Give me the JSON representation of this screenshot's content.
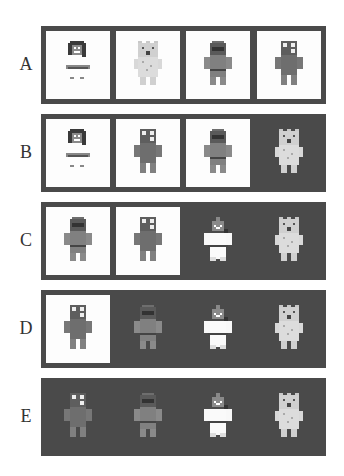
{
  "figure": {
    "rows": [
      {
        "label": "A",
        "cells": [
          {
            "character": "girl",
            "background": "light"
          },
          {
            "character": "bear",
            "background": "light"
          },
          {
            "character": "hooded",
            "background": "light"
          },
          {
            "character": "robot",
            "background": "light"
          }
        ]
      },
      {
        "label": "B",
        "cells": [
          {
            "character": "girl",
            "background": "light"
          },
          {
            "character": "robot",
            "background": "light"
          },
          {
            "character": "hooded",
            "background": "light"
          },
          {
            "character": "bear",
            "background": "dark"
          }
        ]
      },
      {
        "label": "C",
        "cells": [
          {
            "character": "hooded",
            "background": "light"
          },
          {
            "character": "robot",
            "background": "light"
          },
          {
            "character": "chef",
            "background": "dark"
          },
          {
            "character": "bear",
            "background": "dark"
          }
        ]
      },
      {
        "label": "D",
        "cells": [
          {
            "character": "robot",
            "background": "light"
          },
          {
            "character": "hooded",
            "background": "dark"
          },
          {
            "character": "chef",
            "background": "dark"
          },
          {
            "character": "bear",
            "background": "dark"
          }
        ]
      },
      {
        "label": "E",
        "cells": [
          {
            "character": "robot",
            "background": "dark"
          },
          {
            "character": "hooded",
            "background": "dark"
          },
          {
            "character": "chef",
            "background": "dark"
          },
          {
            "character": "bear",
            "background": "dark"
          }
        ]
      }
    ]
  },
  "colors": {
    "panel_frame": "#4a4a4a",
    "light_cell": "#fdfdfd",
    "dark_cell": "#4a4a4a"
  }
}
